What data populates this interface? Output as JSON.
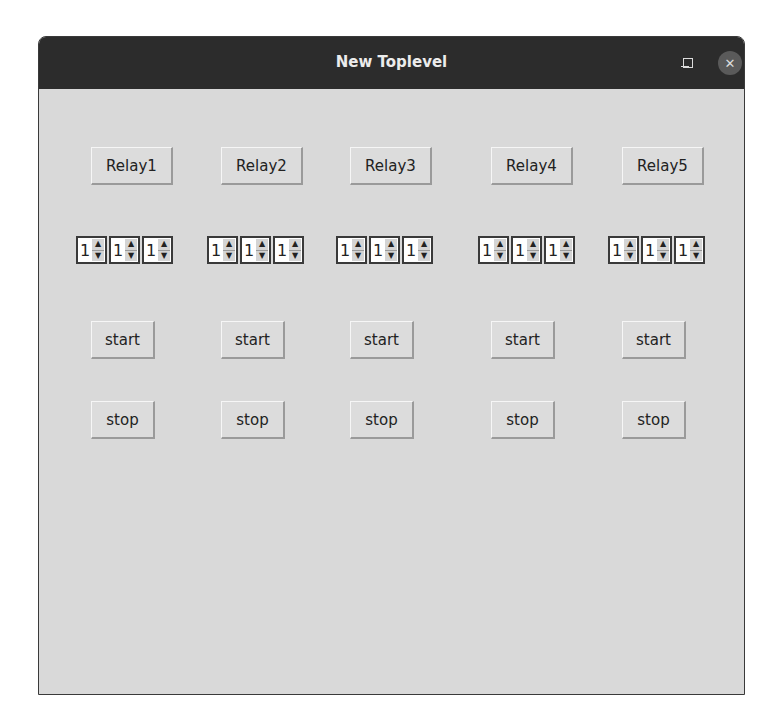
{
  "window": {
    "title": "New Toplevel",
    "controls": {
      "minimize": "–",
      "maximize": "□",
      "close": "✕"
    },
    "colors": {
      "titlebar": "#2c2c2c",
      "body": "#d9d9d9",
      "button": "#dcdcdc"
    }
  },
  "relays": [
    {
      "label": "Relay1",
      "spinboxes": [
        "1",
        "1",
        "1"
      ],
      "start_label": "start",
      "stop_label": "stop"
    },
    {
      "label": "Relay2",
      "spinboxes": [
        "1",
        "1",
        "1"
      ],
      "start_label": "start",
      "stop_label": "stop"
    },
    {
      "label": "Relay3",
      "spinboxes": [
        "1",
        "1",
        "1"
      ],
      "start_label": "start",
      "stop_label": "stop"
    },
    {
      "label": "Relay4",
      "spinboxes": [
        "1",
        "1",
        "1"
      ],
      "start_label": "start",
      "stop_label": "stop"
    },
    {
      "label": "Relay5",
      "spinboxes": [
        "1",
        "1",
        "1"
      ],
      "start_label": "start",
      "stop_label": "stop"
    }
  ],
  "icons": {
    "spin_up": "▲",
    "spin_down": "▼"
  }
}
